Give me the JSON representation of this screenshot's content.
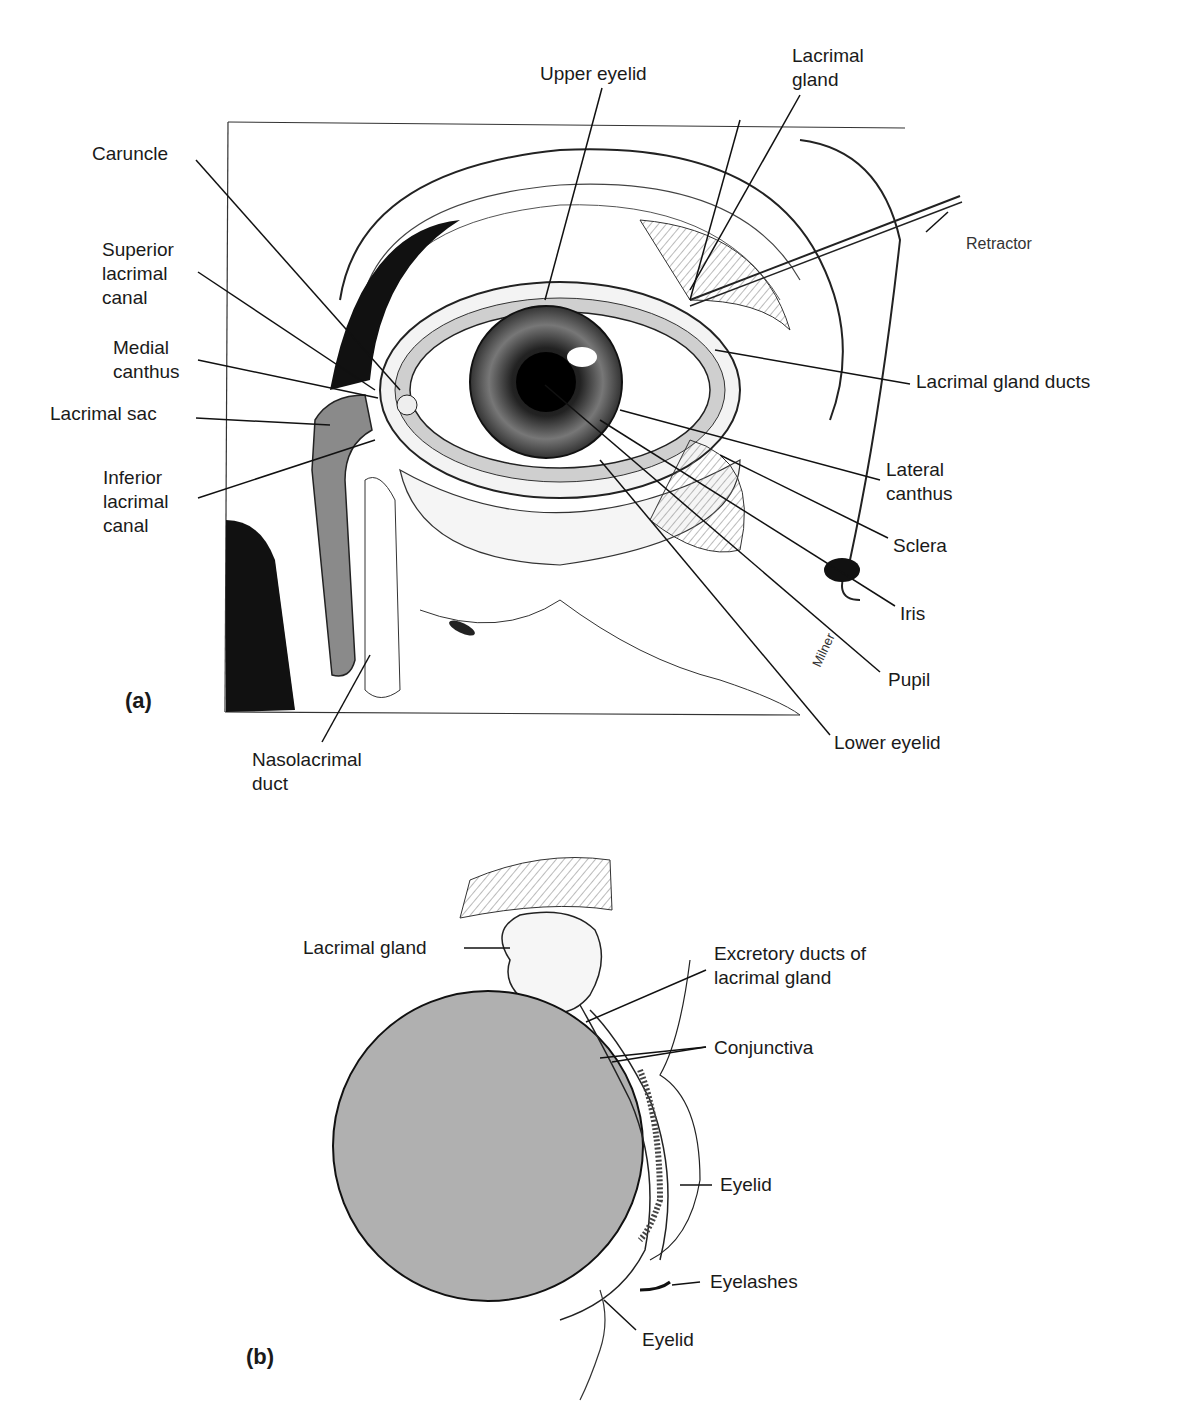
{
  "panel_a": {
    "tag": "(a)",
    "labels": {
      "upper_eyelid": "Upper eyelid",
      "lacrimal_gland_1": "Lacrimal",
      "lacrimal_gland_2": "gland",
      "caruncle": "Caruncle",
      "superior_1": "Superior",
      "superior_2": "lacrimal",
      "superior_3": "canal",
      "medial_1": "Medial",
      "medial_2": "canthus",
      "lacrimal_sac": "Lacrimal sac",
      "inferior_1": "Inferior",
      "inferior_2": "lacrimal",
      "inferior_3": "canal",
      "retractor": "Retractor",
      "gland_ducts": "Lacrimal gland ducts",
      "lateral_1": "Lateral",
      "lateral_2": "canthus",
      "sclera": "Sclera",
      "iris": "Iris",
      "pupil": "Pupil",
      "lower_eyelid": "Lower eyelid",
      "naso_1": "Nasolacrimal",
      "naso_2": "duct",
      "signature": "Milner"
    }
  },
  "panel_b": {
    "tag": "(b)",
    "labels": {
      "lacrimal_gland": "Lacrimal gland",
      "excretory_1": "Excretory ducts of",
      "excretory_2": "lacrimal gland",
      "conjunctiva": "Conjunctiva",
      "eyelid_upper": "Eyelid",
      "eyelashes": "Eyelashes",
      "eyelid_lower": "Eyelid"
    }
  },
  "colors": {
    "shade": "#a9a9a9",
    "tissue": "#8a8a8a",
    "ink": "#1a1a1a"
  }
}
